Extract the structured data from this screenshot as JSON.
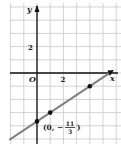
{
  "chart_data": {
    "type": "line",
    "title": "",
    "xlabel": "x",
    "ylabel": "y",
    "origin_label": "O",
    "x_tick_labels": [
      {
        "value": 2,
        "label": "2"
      }
    ],
    "y_tick_labels": [
      {
        "value": 2,
        "label": "2"
      }
    ],
    "xlim": [
      -2,
      6
    ],
    "ylim": [
      -5.3,
      5.3
    ],
    "grid": true,
    "line": {
      "slope": "2/3",
      "intercept": "-11/3",
      "color": "#808080"
    },
    "points": [
      {
        "x": 0,
        "y": -3.6667
      },
      {
        "x": 1,
        "y": -3
      },
      {
        "x": 4,
        "y": -1
      }
    ],
    "annotation": {
      "prefix": "(0, −",
      "numerator": "11",
      "denominator": "3",
      "suffix": ")"
    }
  }
}
